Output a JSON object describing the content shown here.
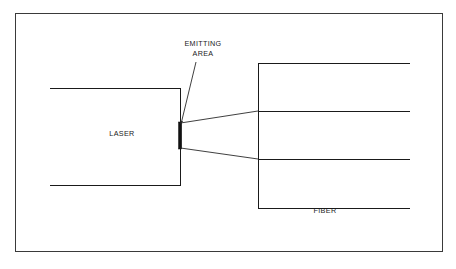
{
  "diagram": {
    "background_color": "#ffffff",
    "line_color": "#1a1a1a",
    "frame": {
      "x": 15.5,
      "y": 13.5,
      "width": 427,
      "height": 238
    },
    "laser": {
      "label": "LASER",
      "label_x": 122,
      "label_y": 136,
      "box": {
        "left": 50,
        "top": 88,
        "right": 180,
        "bottom": 185
      },
      "open_side": "left"
    },
    "emitting_area": {
      "label_line1": "EMITTING",
      "label_line2": "AREA",
      "label_x": 203,
      "label_y1": 46,
      "label_y2": 56,
      "bar": {
        "x": 178.5,
        "top": 122,
        "bottom": 149,
        "width": 3.2
      },
      "leader": {
        "x1": 196,
        "y1": 62,
        "x2": 181,
        "y2": 124
      },
      "arrow_size": 3.4
    },
    "fiber": {
      "label": "FIBER",
      "label_x": 325,
      "label_y": 213,
      "cladding": {
        "left": 258,
        "top": 63,
        "right": 410,
        "bottom": 208,
        "open_side": "right"
      },
      "core_lines": [
        {
          "x1": 258,
          "y1": 111,
          "x2": 410,
          "y2": 111
        },
        {
          "x1": 258,
          "y1": 159,
          "x2": 410,
          "y2": 159
        }
      ]
    },
    "beam_rays": [
      {
        "name": "upper-ray",
        "x1": 180.5,
        "y1": 123,
        "x2": 258,
        "y2": 111
      },
      {
        "name": "lower-ray",
        "x1": 180.5,
        "y1": 148,
        "x2": 258,
        "y2": 159
      }
    ]
  }
}
